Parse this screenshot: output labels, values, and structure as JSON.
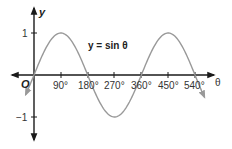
{
  "chart_data": {
    "type": "line",
    "title": "",
    "equation_label": "y = sin θ",
    "xlabel": "θ",
    "ylabel": "y",
    "origin_label": "O",
    "x_ticks": [
      "90°",
      "180°",
      "270°",
      "360°",
      "450°",
      "540°"
    ],
    "x_tick_values": [
      90,
      180,
      270,
      360,
      450,
      540
    ],
    "y_ticks": [
      "1",
      "−1"
    ],
    "y_tick_values": [
      1,
      -1
    ],
    "xlim": [
      -30,
      570
    ],
    "ylim": [
      -1.4,
      1.4
    ],
    "grid": false,
    "series": [
      {
        "name": "y = sin θ",
        "x": [
          0,
          90,
          180,
          270,
          360,
          450,
          540
        ],
        "values": [
          0,
          1,
          0,
          -1,
          0,
          1,
          0
        ],
        "color": "#999999",
        "arrows_both_ends": true
      }
    ]
  },
  "colors": {
    "axis": "#1a1a1a",
    "curve": "#999999",
    "text": "#333333"
  }
}
